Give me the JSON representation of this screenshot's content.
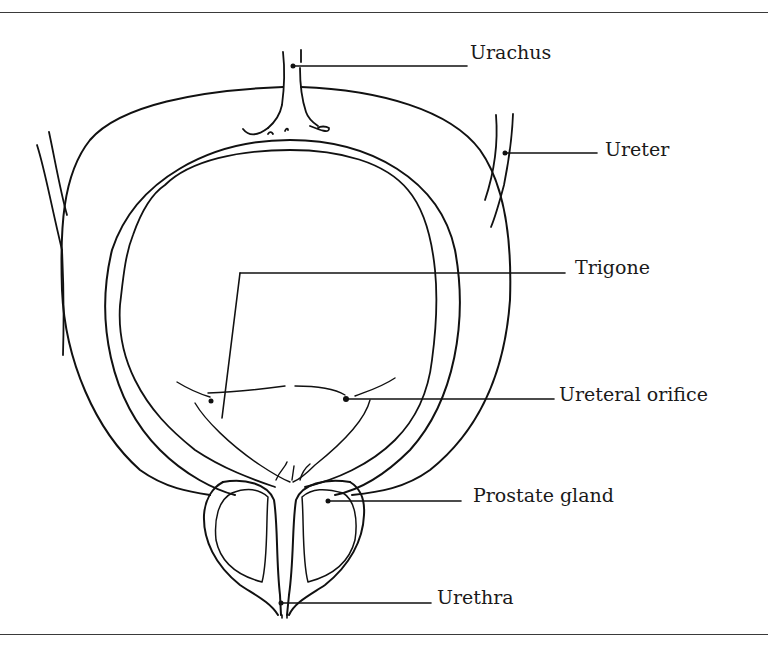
{
  "figure": {
    "line_color": "#111111",
    "background": "#ffffff",
    "labels": [
      {
        "id": "urachus",
        "text": "Urachus"
      },
      {
        "id": "ureter",
        "text": "Ureter"
      },
      {
        "id": "trigone",
        "text": "Trigone"
      },
      {
        "id": "ureteral-orifice",
        "text": "Ureteral orifice"
      },
      {
        "id": "prostate-gland",
        "text": "Prostate gland"
      },
      {
        "id": "urethra",
        "text": "Urethra"
      }
    ]
  }
}
